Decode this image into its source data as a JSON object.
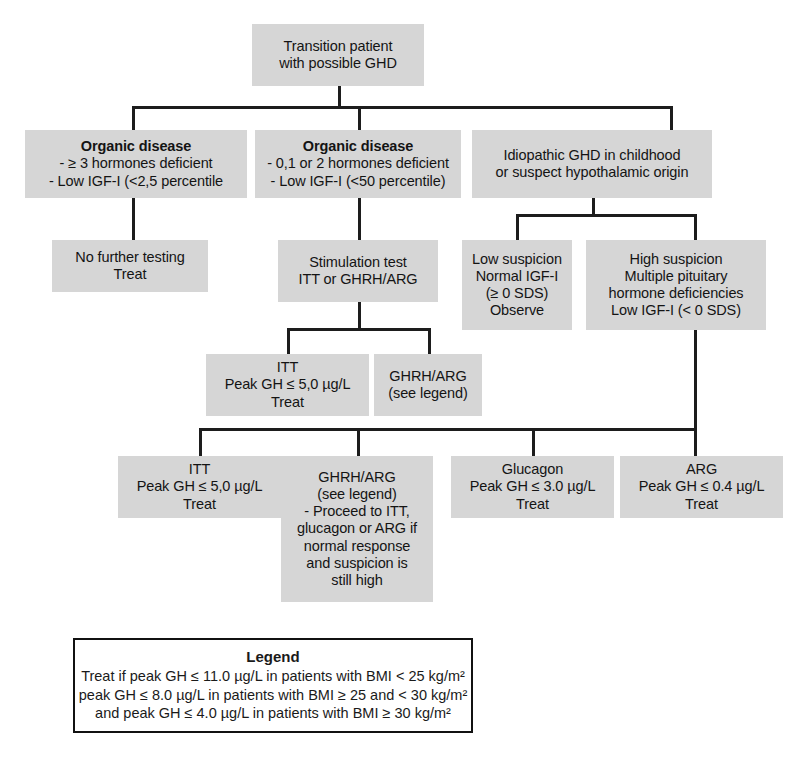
{
  "diagram": {
    "nodes": {
      "root": {
        "lines": [
          "Transition patient",
          "with possible GHD"
        ]
      },
      "organic_severe": {
        "title": "Organic disease",
        "lines": [
          "- ≥ 3 hormones deficient",
          "- Low IGF-I (<2,5 percentile"
        ]
      },
      "organic_mild": {
        "title": "Organic disease",
        "lines": [
          "- 0,1 or 2 hormones deficient",
          "- Low IGF-I (<50 percentile)"
        ]
      },
      "idiopathic": {
        "lines": [
          "Idiopathic GHD in childhood",
          "or suspect hypothalamic origin"
        ]
      },
      "no_further_testing": {
        "lines": [
          "No further testing",
          "Treat"
        ]
      },
      "stimulation_test": {
        "lines": [
          "Stimulation test",
          "ITT or GHRH/ARG"
        ]
      },
      "low_suspicion": {
        "lines": [
          "Low suspicion",
          "Normal IGF-I",
          "(≥ 0 SDS)",
          "Observe"
        ]
      },
      "high_suspicion": {
        "lines": [
          "High suspicion",
          "Multiple pituitary",
          "hormone deficiencies",
          "Low IGF-I (< 0 SDS)"
        ]
      },
      "itt_mid": {
        "lines": [
          "ITT",
          "Peak GH ≤ 5,0 µg/L",
          "Treat"
        ]
      },
      "ghrh_arg_mid": {
        "lines": [
          "GHRH/ARG",
          "(see legend)"
        ]
      },
      "itt_bottom": {
        "lines": [
          "ITT",
          "Peak GH ≤ 5,0 µg/L",
          "Treat"
        ]
      },
      "ghrh_arg_bottom": {
        "lines": [
          "GHRH/ARG",
          "(see legend)",
          "- Proceed to ITT,",
          "glucagon or ARG if",
          "normal response",
          "and suspicion is",
          "still high"
        ]
      },
      "glucagon": {
        "lines": [
          "Glucagon",
          "Peak GH ≤ 3.0 µg/L",
          "Treat"
        ]
      },
      "arg": {
        "lines": [
          "ARG",
          "Peak GH ≤ 0.4 µg/L",
          "Treat"
        ]
      }
    },
    "legend": {
      "title": "Legend",
      "lines": [
        "Treat if peak GH ≤ 11.0 µg/L in patients with BMI < 25 kg/m²",
        "peak GH ≤ 8.0 µg/L in patients with BMI ≥ 25 and < 30 kg/m²",
        "and peak GH ≤ 4.0 µg/L in patients with BMI ≥ 30 kg/m²"
      ]
    },
    "colors": {
      "node_fill": "#d6d6d6",
      "connector": "#1d1d1d",
      "legend_border": "#111111",
      "background": "#ffffff",
      "text": "#141414"
    }
  }
}
